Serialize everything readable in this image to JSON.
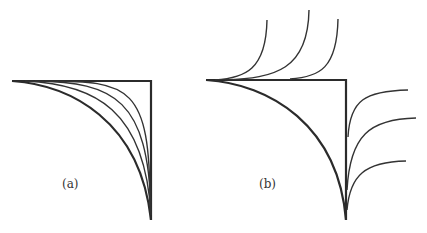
{
  "figure": {
    "panels": [
      {
        "id": "a",
        "label": "(a)",
        "description": "Quarter-curve family converging from a quarter-ellipse toward the square corner",
        "corner": {
          "x": 151,
          "y": 81
        },
        "top_line_start": {
          "x": 12,
          "y": 81
        },
        "bottom_tip": {
          "x": 151,
          "y": 220
        },
        "interior_curve_count": 4
      },
      {
        "id": "b",
        "label": "(b)",
        "description": "Quarter-ellipse inside square with curves diverging outward from the top edge and right edge",
        "corner": {
          "x": 346,
          "y": 80
        },
        "top_line_start": {
          "x": 206,
          "y": 80
        },
        "bottom_tip": {
          "x": 346,
          "y": 220
        },
        "upward_curve_count": 3,
        "rightward_curve_count": 3
      }
    ],
    "colors": {
      "stroke": "#2b2b2b",
      "background": "#ffffff"
    }
  }
}
